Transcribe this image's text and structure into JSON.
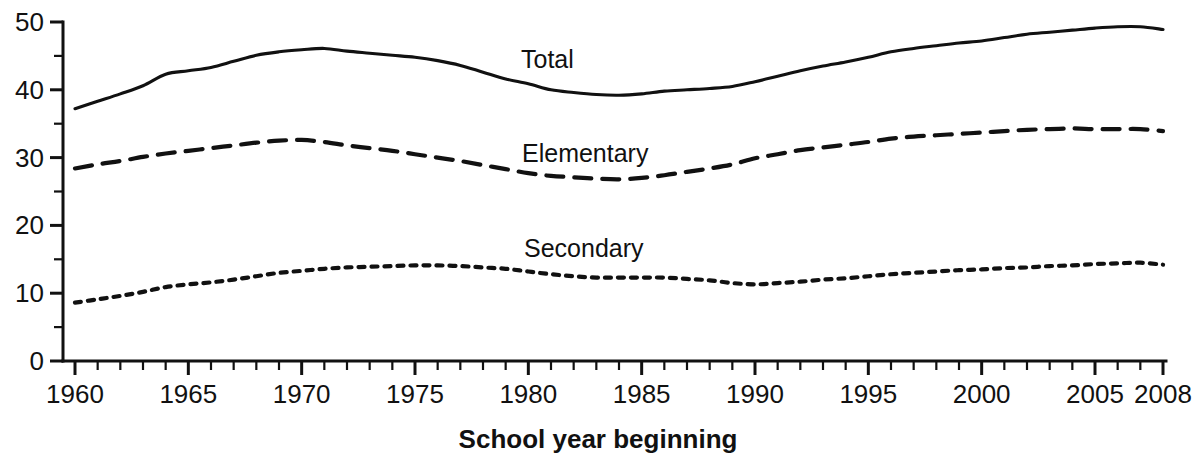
{
  "chart_data": {
    "type": "line",
    "title": "",
    "subtitle": "",
    "xlabel": "School year beginning",
    "ylabel": "",
    "xlim": [
      1960,
      2008
    ],
    "ylim": [
      0,
      50
    ],
    "grid": false,
    "legend_position": "inline-annotations",
    "x_tick_labels": [
      "1960",
      "1965",
      "1970",
      "1975",
      "1980",
      "1985",
      "1990",
      "1995",
      "2000",
      "2005",
      "2008"
    ],
    "x_tick_values": [
      1960,
      1965,
      1970,
      1975,
      1980,
      1985,
      1990,
      1995,
      2000,
      2005,
      2008
    ],
    "x_minor_tick_step": 1,
    "y_tick_labels": [
      "0",
      "10",
      "20",
      "30",
      "40",
      "50"
    ],
    "y_tick_values": [
      0,
      10,
      20,
      30,
      40,
      50
    ],
    "y_minor_tick_values": [
      5,
      15,
      25,
      35,
      45
    ],
    "units": "millions of students",
    "x": [
      1960,
      1961,
      1962,
      1963,
      1964,
      1965,
      1966,
      1967,
      1968,
      1969,
      1970,
      1971,
      1972,
      1973,
      1974,
      1975,
      1976,
      1977,
      1978,
      1979,
      1980,
      1981,
      1982,
      1983,
      1984,
      1985,
      1986,
      1987,
      1988,
      1989,
      1990,
      1991,
      1992,
      1993,
      1994,
      1995,
      1996,
      1997,
      1998,
      1999,
      2000,
      2001,
      2002,
      2003,
      2004,
      2005,
      2006,
      2007,
      2008
    ],
    "series": [
      {
        "name": "Total",
        "style": "solid",
        "label_text": "Total",
        "values": [
          37.2,
          38.3,
          39.4,
          40.6,
          42.3,
          42.8,
          43.3,
          44.2,
          45.1,
          45.6,
          45.9,
          46.1,
          45.7,
          45.4,
          45.1,
          44.8,
          44.3,
          43.6,
          42.6,
          41.6,
          40.9,
          40.0,
          39.6,
          39.3,
          39.2,
          39.4,
          39.8,
          40.0,
          40.2,
          40.5,
          41.2,
          42.0,
          42.8,
          43.5,
          44.1,
          44.8,
          45.6,
          46.1,
          46.5,
          46.9,
          47.2,
          47.7,
          48.2,
          48.5,
          48.8,
          49.1,
          49.3,
          49.3,
          48.9
        ]
      },
      {
        "name": "Elementary",
        "style": "dashed",
        "label_text": "Elementary",
        "values": [
          28.4,
          29.0,
          29.5,
          30.1,
          30.6,
          31.0,
          31.4,
          31.8,
          32.2,
          32.5,
          32.6,
          32.3,
          31.8,
          31.4,
          31.0,
          30.5,
          30.0,
          29.5,
          28.9,
          28.3,
          27.7,
          27.3,
          27.1,
          26.9,
          26.8,
          27.0,
          27.4,
          27.9,
          28.4,
          29.0,
          29.9,
          30.5,
          31.1,
          31.5,
          31.9,
          32.3,
          32.8,
          33.1,
          33.3,
          33.5,
          33.7,
          33.9,
          34.1,
          34.2,
          34.3,
          34.2,
          34.2,
          34.2,
          33.9
        ]
      },
      {
        "name": "Secondary",
        "style": "dotted",
        "label_text": "Secondary",
        "values": [
          8.6,
          9.1,
          9.6,
          10.2,
          10.9,
          11.3,
          11.6,
          12.0,
          12.5,
          13.0,
          13.3,
          13.6,
          13.8,
          13.9,
          14.0,
          14.1,
          14.1,
          14.0,
          13.8,
          13.6,
          13.2,
          12.8,
          12.5,
          12.3,
          12.3,
          12.3,
          12.3,
          12.1,
          11.9,
          11.5,
          11.3,
          11.5,
          11.7,
          12.0,
          12.2,
          12.5,
          12.8,
          13.0,
          13.2,
          13.4,
          13.5,
          13.7,
          13.8,
          14.0,
          14.1,
          14.3,
          14.4,
          14.5,
          14.2
        ]
      }
    ],
    "annotations": [
      {
        "text": "Total",
        "x_px": 521,
        "y_px": 68,
        "series": "Total"
      },
      {
        "text": "Elementary",
        "x_px": 522,
        "y_px": 162,
        "series": "Elementary"
      },
      {
        "text": "Secondary",
        "x_px": 524,
        "y_px": 257,
        "series": "Secondary"
      }
    ],
    "colors": {
      "line": "#111111",
      "axis": "#111111",
      "text": "#111111",
      "background": "#ffffff"
    }
  }
}
